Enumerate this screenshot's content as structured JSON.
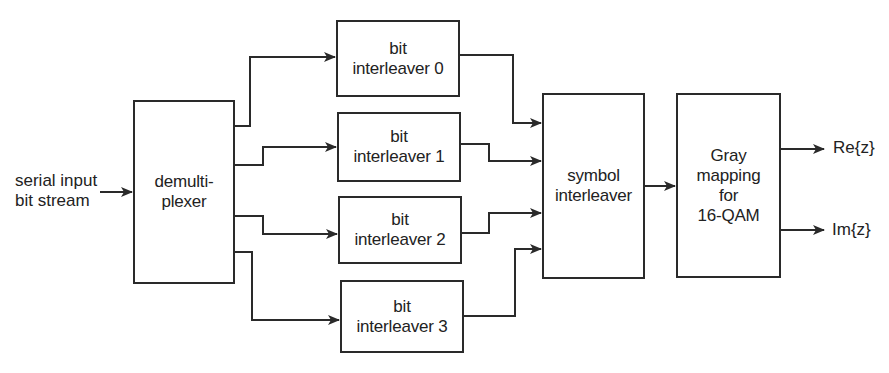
{
  "diagram": {
    "input_label": "serial input\nbit stream",
    "blocks": {
      "demux": "demulti-\nplexer",
      "bit_interleavers": [
        "bit\ninterleaver 0",
        "bit\ninterleaver 1",
        "bit\ninterleaver 2",
        "bit\ninterleaver 3"
      ],
      "symbol_interleaver": "symbol\ninterleaver",
      "gray_mapping": "Gray\nmapping\nfor\n16-QAM"
    },
    "outputs": [
      "Re{z}",
      "Im{z}"
    ],
    "colors": {
      "line": "#2a2a2a",
      "background": "#ffffff"
    }
  }
}
